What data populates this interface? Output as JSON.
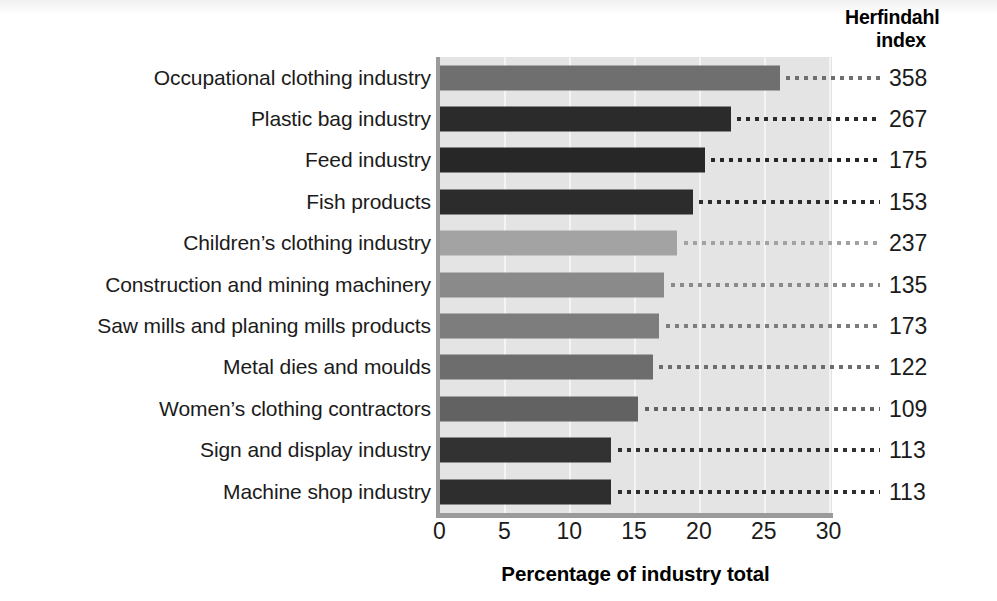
{
  "chart_data": {
    "type": "bar",
    "orientation": "horizontal",
    "title": "",
    "xlabel": "Percentage of industry total",
    "ylabel": "",
    "xlim": [
      0,
      30
    ],
    "xticks": [
      "0",
      "5",
      "10",
      "15",
      "20",
      "25",
      "30"
    ],
    "grid": true,
    "legend": false,
    "secondary_column_header_line1": "Herfindahl",
    "secondary_column_header_line2": "index",
    "categories": [
      "Occupational clothing industry",
      "Plastic bag industry",
      "Feed industry",
      "Fish products",
      "Children’s clothing industry",
      "Construction and mining machinery",
      "Saw mills and planing mills products",
      "Metal dies and moulds",
      "Women’s clothing contractors",
      "Sign and display industry",
      "Machine shop industry"
    ],
    "values": [
      26.2,
      22.4,
      20.4,
      19.5,
      18.3,
      17.3,
      16.9,
      16.4,
      15.3,
      13.2,
      13.2
    ],
    "herfindahl_index": [
      358,
      267,
      175,
      153,
      237,
      135,
      173,
      122,
      109,
      113,
      113
    ],
    "bar_colors": [
      "#6f6f6f",
      "#2b2b2b",
      "#272727",
      "#2c2c2c",
      "#a3a3a3",
      "#8a8a8a",
      "#7d7d7d",
      "#6d6d6d",
      "#626262",
      "#323232",
      "#2e2e2e"
    ],
    "plot_background": "#e4e4e4",
    "gridline_color": "#f4f4f4",
    "axis_color": "#9b9b9b"
  },
  "axis": {
    "xticks": [
      {
        "label": "0",
        "value": 0
      },
      {
        "label": "5",
        "value": 5
      },
      {
        "label": "10",
        "value": 10
      },
      {
        "label": "15",
        "value": 15
      },
      {
        "label": "20",
        "value": 20
      },
      {
        "label": "25",
        "value": 25
      },
      {
        "label": "30",
        "value": 30
      }
    ],
    "xtitle": "Percentage of industry total"
  }
}
